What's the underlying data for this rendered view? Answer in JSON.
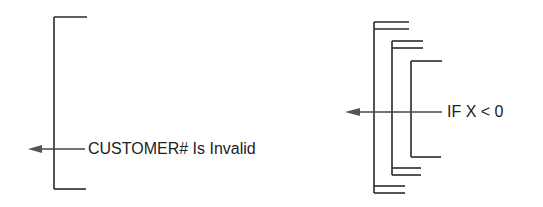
{
  "left_diagram": {
    "label": "CUSTOMER# Is Invalid"
  },
  "right_diagram": {
    "label": "IF X < 0"
  },
  "colors": {
    "line": "#2a2a2a",
    "arrow": "#555555"
  }
}
